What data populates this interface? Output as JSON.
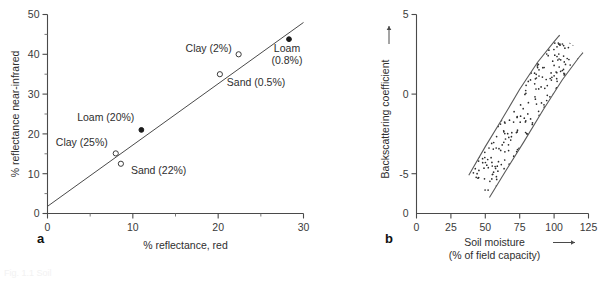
{
  "figure": {
    "panels": [
      {
        "letter": "a"
      },
      {
        "letter": "b"
      }
    ],
    "ghost_caption": "Fig. 1.1   Soil"
  },
  "chart_data": [
    {
      "type": "scatter",
      "panel": "a",
      "title": "",
      "xlabel": "% reflectance, red",
      "ylabel": "% reflectance near-infrared",
      "xlim": [
        0,
        30
      ],
      "ylim": [
        0,
        50
      ],
      "xticks": [
        0,
        10,
        20,
        30
      ],
      "xticklabels": [
        "0",
        "10",
        "20",
        "30"
      ],
      "xminorticks": [
        5,
        15,
        25
      ],
      "yticks": [
        0,
        10,
        20,
        30,
        40,
        50
      ],
      "yticklabels": [
        "0",
        "10",
        "20",
        "30",
        "40",
        "50"
      ],
      "yminorticks": [
        5,
        15,
        25,
        35,
        45
      ],
      "grid": false,
      "legend": "none",
      "points": [
        {
          "label": "Sand (22%)",
          "x": 8.6,
          "y": 12.5,
          "marker": "open",
          "label_dx": 10,
          "label_dy": 10,
          "anchor": "start"
        },
        {
          "label": "Clay (25%)",
          "x": 8.0,
          "y": 15.1,
          "marker": "open",
          "label_dx": -8,
          "label_dy": -7,
          "anchor": "end"
        },
        {
          "label": "Loam (20%)",
          "x": 11.0,
          "y": 21.0,
          "marker": "filled",
          "label_dx": -7,
          "label_dy": -9,
          "anchor": "end"
        },
        {
          "label": "Sand (0.5%)",
          "x": 20.2,
          "y": 35.0,
          "marker": "open",
          "label_dx": 7,
          "label_dy": 12,
          "anchor": "start"
        },
        {
          "label": "Clay (2%)",
          "x": 22.4,
          "y": 40.0,
          "marker": "open",
          "label_dx": -7,
          "label_dy": -2,
          "anchor": "end"
        },
        {
          "label": "Loam\n(0.8%)",
          "x": 28.3,
          "y": 43.8,
          "marker": "filled",
          "label_dx": -2,
          "label_dy": 13,
          "anchor": "middle"
        }
      ],
      "fit_line": {
        "x0": 0.0,
        "y0": 1.8,
        "x1": 30.0,
        "y1": 48.0
      }
    },
    {
      "type": "area",
      "panel": "b",
      "title": "",
      "xlabel": "Soil moisture",
      "xlabel_sub": "(% of field capacity)",
      "ylabel": "Backscattering coefficient",
      "xlim": [
        0,
        125
      ],
      "ylim": [
        -7.5,
        5
      ],
      "xticks": [
        0,
        25,
        50,
        75,
        100,
        125
      ],
      "xticklabels": [
        "0",
        "25",
        "50",
        "75",
        "100",
        "125"
      ],
      "yticks": [
        -5,
        0,
        5
      ],
      "yticklabels": [
        "-5",
        "0",
        "5"
      ],
      "y_origin_label": "0",
      "grid": false,
      "legend": "none",
      "band_upper": [
        {
          "x": 38,
          "y": -5.1
        },
        {
          "x": 50,
          "y": -3.3
        },
        {
          "x": 62,
          "y": -1.6
        },
        {
          "x": 75,
          "y": 0.3
        },
        {
          "x": 88,
          "y": 2.0
        },
        {
          "x": 100,
          "y": 3.3
        },
        {
          "x": 104,
          "y": 3.7
        }
      ],
      "band_lower": [
        {
          "x": 53,
          "y": -6.5
        },
        {
          "x": 65,
          "y": -4.8
        },
        {
          "x": 78,
          "y": -3.0
        },
        {
          "x": 92,
          "y": -1.0
        },
        {
          "x": 106,
          "y": 0.9
        },
        {
          "x": 118,
          "y": 2.3
        },
        {
          "x": 121,
          "y": 2.6
        }
      ],
      "fill_pattern": "dotted-speckle"
    }
  ]
}
